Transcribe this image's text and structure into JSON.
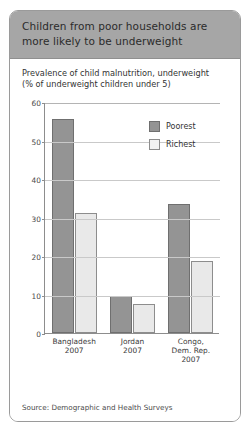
{
  "card": {
    "title": "Children from poor households are more likely to be underweight",
    "source": "Source: Demographic and Health Surveys"
  },
  "chart_data": {
    "type": "bar",
    "title": "Prevalence of child malnutrition, underweight",
    "subtitle": "(% of underweight children under 5)",
    "xlabel": "",
    "ylabel": "",
    "ylim": [
      0,
      60
    ],
    "yticks": [
      0,
      10,
      20,
      30,
      40,
      50,
      60
    ],
    "grid": true,
    "legend_position": "top-right",
    "categories": [
      "Bangladesh\n2007",
      "Jordan\n2007",
      "Congo,\nDem. Rep.\n2007"
    ],
    "category_lines": [
      [
        "Bangladesh",
        "2007"
      ],
      [
        "Jordan",
        "2007"
      ],
      [
        "Congo,",
        "Dem. Rep.",
        "2007"
      ]
    ],
    "series": [
      {
        "name": "Poorest",
        "color": "#949494",
        "values": [
          55.5,
          9.5,
          33.4
        ]
      },
      {
        "name": "Richest",
        "color": "#e9e9e9",
        "values": [
          31.3,
          7.5,
          18.7
        ]
      }
    ]
  },
  "colors": {
    "header_band": "#a6a6a6",
    "card_border": "#9a9a9a",
    "poorest": "#949494",
    "richest": "#e9e9e9",
    "gridline": "#c9c9c9",
    "axis": "#8d8d8d"
  }
}
